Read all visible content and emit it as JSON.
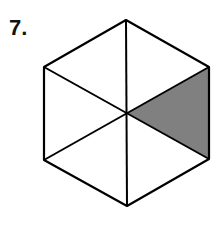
{
  "problem": {
    "number_label": "7."
  },
  "figure": {
    "shape": "regular hexagon",
    "divisions": 6,
    "shaded_parts": 1,
    "fill_color": "#808080",
    "stroke_color": "#000000",
    "background_color": "#ffffff"
  }
}
